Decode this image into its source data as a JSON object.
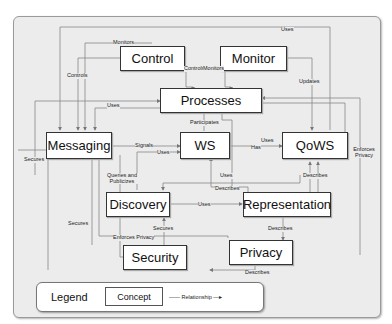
{
  "diagram": {
    "concepts": [
      {
        "id": "control",
        "label": "Control"
      },
      {
        "id": "monitor",
        "label": "Monitor"
      },
      {
        "id": "processes",
        "label": "Processes"
      },
      {
        "id": "messaging",
        "label": "Messaging"
      },
      {
        "id": "ws",
        "label": "WS"
      },
      {
        "id": "qows",
        "label": "QoWS"
      },
      {
        "id": "discovery",
        "label": "Discovery"
      },
      {
        "id": "representation",
        "label": "Representation"
      },
      {
        "id": "security",
        "label": "Security"
      },
      {
        "id": "privacy",
        "label": "Privacy"
      }
    ],
    "relationships": [
      {
        "label": "Monitors",
        "from": "monitor",
        "to": "messaging"
      },
      {
        "label": "Uses",
        "from": "qows",
        "to": "messaging"
      },
      {
        "label": "Controls",
        "from": "control",
        "to": "messaging"
      },
      {
        "label": "Controls",
        "from": "control",
        "to": "processes"
      },
      {
        "label": "Monitors",
        "from": "monitor",
        "to": "processes"
      },
      {
        "label": "Updates",
        "from": "monitor",
        "to": "qows"
      },
      {
        "label": "Uses",
        "from": "processes",
        "to": "messaging"
      },
      {
        "label": "Participates",
        "from": "ws",
        "to": "processes"
      },
      {
        "label": "Signals",
        "from": "messaging",
        "to": "ws"
      },
      {
        "label": "Uses",
        "from": "discovery",
        "to": "ws"
      },
      {
        "label": "Uses",
        "from": "ws",
        "to": "qows"
      },
      {
        "label": "Has",
        "from": "ws",
        "to": "qows"
      },
      {
        "label": "Enforces Privacy",
        "from": "privacy",
        "to": "processes"
      },
      {
        "label": "Secures",
        "from": "security",
        "to": "messaging"
      },
      {
        "label": "Queries and Publicizes",
        "from": "discovery",
        "to": "messaging"
      },
      {
        "label": "Uses",
        "from": "representation",
        "to": "ws"
      },
      {
        "label": "Describes",
        "from": "representation",
        "to": "ws"
      },
      {
        "label": "Describes",
        "from": "representation",
        "to": "qows"
      },
      {
        "label": "Uses",
        "from": "discovery",
        "to": "representation"
      },
      {
        "label": "Secures",
        "from": "security",
        "to": "discovery"
      },
      {
        "label": "Secures",
        "from": "security",
        "to": "messaging"
      },
      {
        "label": "Enforces Privacy",
        "from": "privacy",
        "to": "messaging"
      },
      {
        "label": "Describes",
        "from": "representation",
        "to": "privacy"
      },
      {
        "label": "Describes",
        "from": "privacy",
        "to": "security"
      }
    ]
  },
  "labels": {
    "monitors_top": "Monitors",
    "uses_top": "Uses",
    "controls_left": "Controls",
    "controls_mid": "Controls",
    "monitors_mid": "Monitors",
    "updates": "Updates",
    "uses_proc": "Uses",
    "participates": "Participates",
    "signals": "Signals",
    "uses_ws": "Uses",
    "uses_qows": "Uses",
    "has": "Has",
    "enforces_privacy_right": "Enforces Privacy",
    "secures_left": "Secures",
    "queries": "Queries and Publicizes",
    "uses_rep": "Uses",
    "describes_ws": "Describes",
    "describes_qows": "Describes",
    "uses_disc_rep": "Uses",
    "secures_disc": "Secures",
    "secures_msg": "Secures",
    "enforces_privacy_bottom": "Enforces Privacy",
    "describes_priv": "Describes",
    "describes_sec": "Describes"
  },
  "legend": {
    "title": "Legend",
    "concept": "Concept",
    "relationship": "Relationship"
  }
}
